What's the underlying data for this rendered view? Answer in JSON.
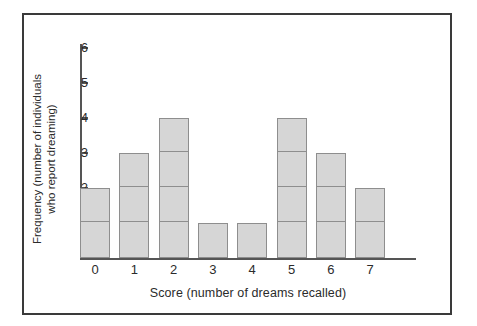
{
  "figure": {
    "frame_color": "#3a3a3a",
    "background": "#ffffff"
  },
  "chart_data": {
    "type": "bar",
    "title": "",
    "subtitle": "",
    "xlabel": "Score (number of dreams recalled)",
    "ylabel": "Frequency (number of individuals who report dreaming)",
    "ylabel_line1": "Frequency (number of individuals",
    "ylabel_line2": "who report dreaming)",
    "categories": [
      "0",
      "1",
      "2",
      "3",
      "4",
      "5",
      "6",
      "7"
    ],
    "values": [
      2,
      3,
      4,
      1,
      1,
      4,
      3,
      2
    ],
    "x_tick_labels": [
      "0",
      "1",
      "2",
      "3",
      "4",
      "5",
      "6",
      "7"
    ],
    "y_tick_labels": [
      "1",
      "2",
      "3",
      "4",
      "5",
      "6"
    ],
    "y_tick_values": [
      1,
      2,
      3,
      4,
      5,
      6
    ],
    "ylim": [
      0,
      6.3
    ],
    "xlim": [
      -0.5,
      7.5
    ],
    "grid": false,
    "legend": false,
    "legend_position": "none",
    "bar_fill_color": "#d6d6d6",
    "bar_edge_color": "#8e8e8e",
    "axis_color": "#555555",
    "stacked_unit_segments": true,
    "annotations": []
  },
  "axis": {
    "y_ticks": [
      {
        "label": "6",
        "value": 6
      },
      {
        "label": "5",
        "value": 5
      },
      {
        "label": "4",
        "value": 4
      },
      {
        "label": "3",
        "value": 3
      },
      {
        "label": "2",
        "value": 2
      },
      {
        "label": "1",
        "value": 1
      }
    ],
    "x_ticks": [
      {
        "label": "0",
        "value": 0
      },
      {
        "label": "1",
        "value": 1
      },
      {
        "label": "2",
        "value": 2
      },
      {
        "label": "3",
        "value": 3
      },
      {
        "label": "4",
        "value": 4
      },
      {
        "label": "5",
        "value": 5
      },
      {
        "label": "6",
        "value": 6
      },
      {
        "label": "7",
        "value": 7
      }
    ]
  }
}
